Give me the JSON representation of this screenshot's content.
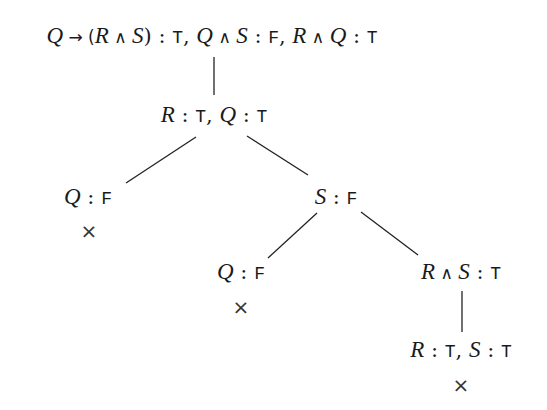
{
  "diagram": {
    "type": "semantic tableau (truth tree)",
    "nodes": [
      {
        "id": "root",
        "text": "Q → (R ∧ S) : T, Q ∧ S : F, R ∧ Q : T",
        "x": 212,
        "y": 37,
        "closed": false
      },
      {
        "id": "n1",
        "text": "R : T, Q : T",
        "x": 214,
        "y": 116,
        "closed": false
      },
      {
        "id": "n2",
        "text": "Q : F",
        "x": 88,
        "y": 198,
        "closed": true
      },
      {
        "id": "n3",
        "text": "S : F",
        "x": 336,
        "y": 198,
        "closed": false
      },
      {
        "id": "n4",
        "text": "Q : F",
        "x": 241,
        "y": 273,
        "closed": true
      },
      {
        "id": "n5",
        "text": "R ∧ S : T",
        "x": 461,
        "y": 273,
        "closed": false
      },
      {
        "id": "n6",
        "text": "R : T, S : T",
        "x": 461,
        "y": 351,
        "closed": true
      }
    ],
    "edges": [
      {
        "from": "root",
        "to": "n1"
      },
      {
        "from": "n1",
        "to": "n2"
      },
      {
        "from": "n1",
        "to": "n3"
      },
      {
        "from": "n3",
        "to": "n4"
      },
      {
        "from": "n3",
        "to": "n5"
      },
      {
        "from": "n5",
        "to": "n6"
      }
    ],
    "closed_marker": "×"
  },
  "labels": {
    "root": {
      "p1": "Q",
      "arrow": " → (",
      "p2": "R",
      "and1": " ∧ ",
      "p3": "S",
      "close": ") : ",
      "v1": "T",
      "c1": ", ",
      "p4": "Q",
      "and2": " ∧ ",
      "p5": "S",
      "colon2": " : ",
      "v2": "F",
      "c2": ", ",
      "p6": "R",
      "and3": " ∧ ",
      "p7": "Q",
      "colon3": " : ",
      "v3": "T"
    },
    "n1": {
      "p1": "R",
      "colon1": " : ",
      "v1": "T",
      "c1": ", ",
      "p2": "Q",
      "colon2": " : ",
      "v2": "T"
    },
    "n2": {
      "p1": "Q",
      "colon1": " : ",
      "v1": "F"
    },
    "n3": {
      "p1": "S",
      "colon1": " : ",
      "v1": "F"
    },
    "n4": {
      "p1": "Q",
      "colon1": " : ",
      "v1": "F"
    },
    "n5": {
      "p1": "R",
      "and1": " ∧ ",
      "p2": "S",
      "colon1": " : ",
      "v1": "T"
    },
    "n6": {
      "p1": "R",
      "colon1": " : ",
      "v1": "T",
      "c1": ", ",
      "p2": "S",
      "colon2": " : ",
      "v2": "T"
    },
    "cross": "×"
  }
}
